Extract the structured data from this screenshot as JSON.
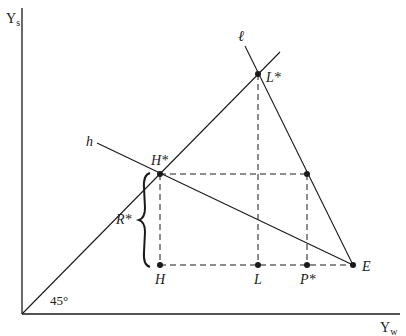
{
  "axes": {
    "y_label_main": "Y",
    "y_label_sub": "s",
    "x_label_main": "Y",
    "x_label_sub": "w",
    "angle_label": "45°"
  },
  "lines": {
    "ell_label": "ℓ",
    "h_label": "h"
  },
  "points": {
    "L_star": "L*",
    "H_star": "H*",
    "R_star": "R*",
    "H": "H",
    "L": "L",
    "P_star": "P*",
    "E": "E"
  },
  "colors": {
    "ink": "#1a1a1a",
    "background": "#ffffff"
  }
}
